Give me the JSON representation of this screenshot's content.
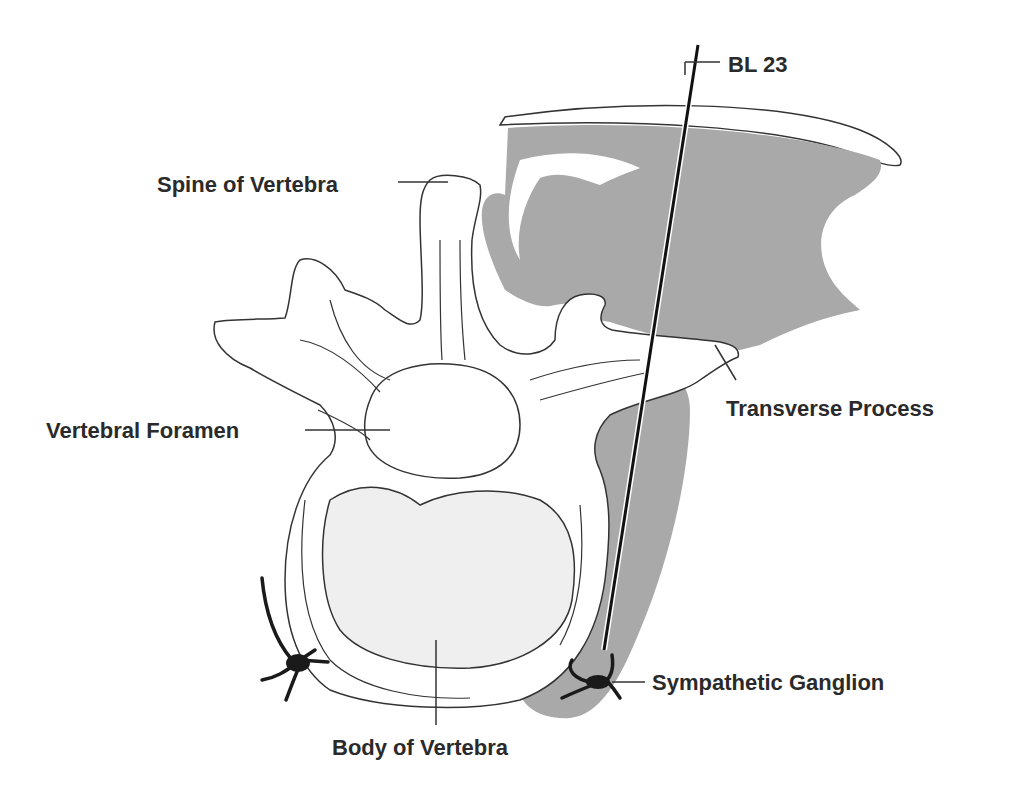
{
  "figure": {
    "type": "anatomical cross-section diagram",
    "labels": {
      "needle_point": "BL 23",
      "spine": "Spine of Vertebra",
      "foramen": "Vertebral Foramen",
      "transverse": "Transverse Process",
      "ganglion": "Sympathetic Ganglion",
      "body": "Body of Vertebra"
    },
    "colors": {
      "muscle": "#a9a9a9",
      "bone_outline": "#333333",
      "vertebral_body_fill": "#efefef",
      "needle": "#111111",
      "background": "#ffffff"
    }
  }
}
